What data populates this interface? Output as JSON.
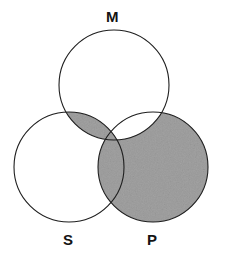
{
  "diagram": {
    "type": "venn",
    "title": "",
    "sets": [
      {
        "key": "M",
        "label": "M",
        "role": "middle-term",
        "cx": 114,
        "cy": 85,
        "r": 55,
        "label_x": 106,
        "label_y": 9
      },
      {
        "key": "S",
        "label": "S",
        "role": "subject-term",
        "cx": 69,
        "cy": 167,
        "r": 55,
        "label_x": 63,
        "label_y": 232
      },
      {
        "key": "P",
        "label": "P",
        "role": "predicate-term",
        "cx": 153,
        "cy": 167,
        "r": 55,
        "label_x": 147,
        "label_y": 232
      }
    ],
    "regions": [
      {
        "id": "M-only",
        "sets": [
          "M"
        ],
        "shaded": false
      },
      {
        "id": "S-only",
        "sets": [
          "S"
        ],
        "shaded": false
      },
      {
        "id": "P-only",
        "sets": [
          "P"
        ],
        "shaded": true
      },
      {
        "id": "M-and-S",
        "sets": [
          "M",
          "S"
        ],
        "shaded": true
      },
      {
        "id": "M-and-P",
        "sets": [
          "M",
          "P"
        ],
        "shaded": false
      },
      {
        "id": "S-and-P",
        "sets": [
          "S",
          "P"
        ],
        "shaded": true
      },
      {
        "id": "M-and-S-and-P",
        "sets": [
          "M",
          "S",
          "P"
        ],
        "shaded": true
      }
    ],
    "colors": {
      "shade": "#c9c9c9",
      "stroke": "#1e1e1e",
      "background": "#ffffff",
      "label": "#141414"
    },
    "stroke_width": 1.1
  }
}
